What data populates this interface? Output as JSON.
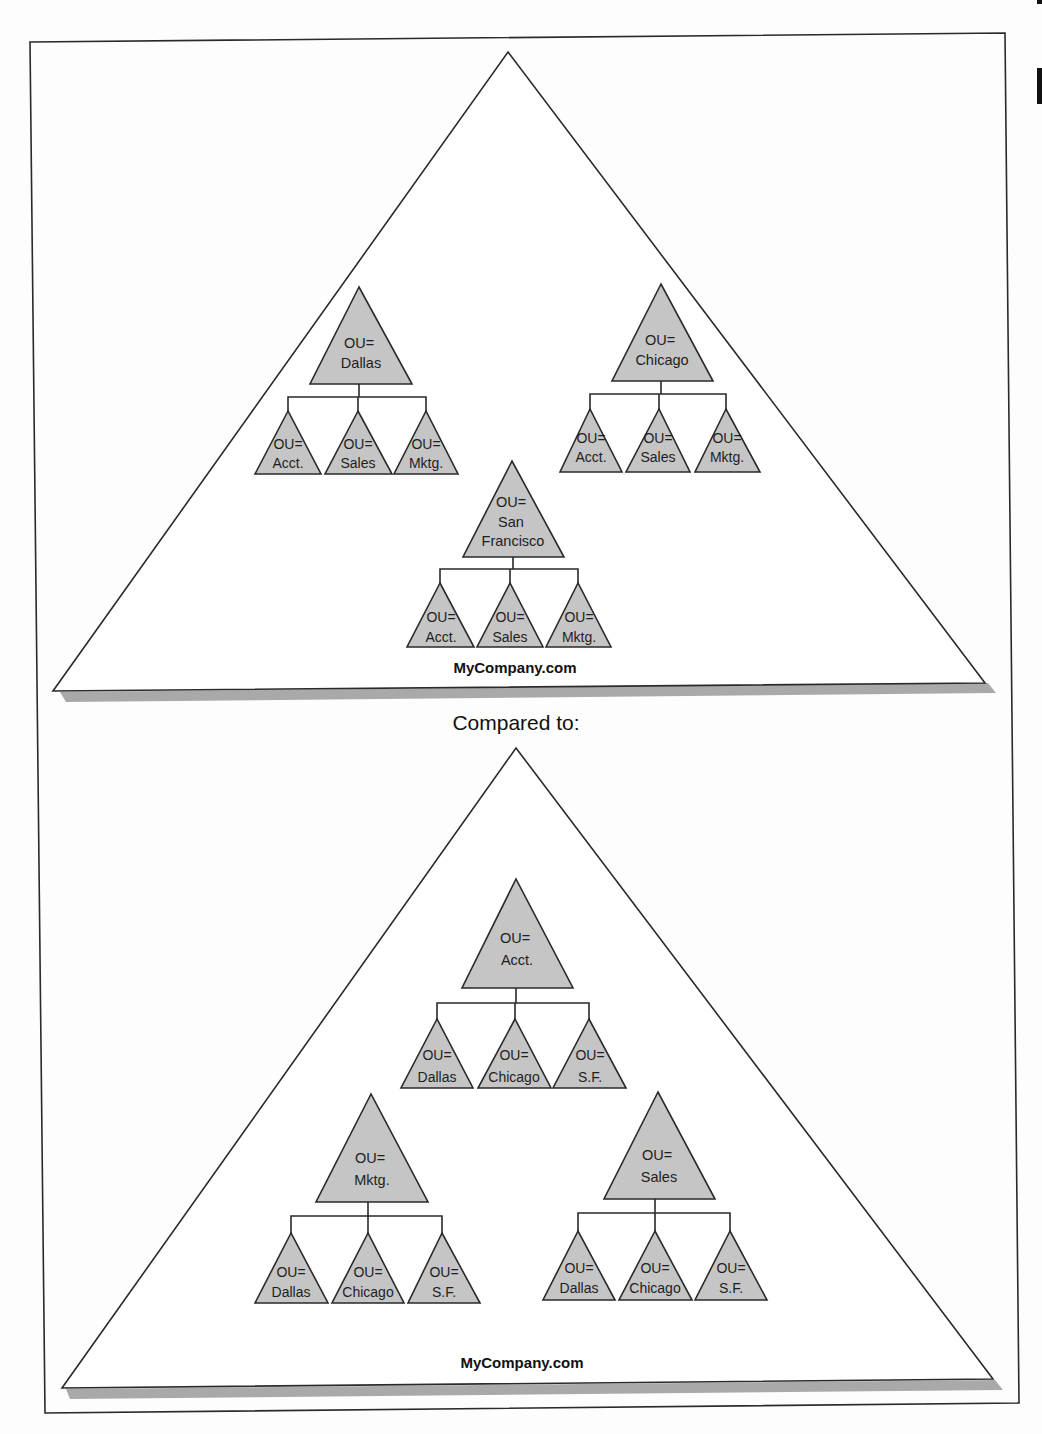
{
  "separator_text": "Compared to:",
  "diagrams": [
    {
      "root_label": "MyCompany.com",
      "ous": [
        {
          "label": [
            "OU=",
            "Dallas"
          ],
          "children": [
            [
              "OU=",
              "Acct."
            ],
            [
              "OU=",
              "Sales"
            ],
            [
              "OU=",
              "Mktg."
            ]
          ]
        },
        {
          "label": [
            "OU=",
            "Chicago"
          ],
          "children": [
            [
              "OU=",
              "Acct."
            ],
            [
              "OU=",
              "Sales"
            ],
            [
              "OU=",
              "Mktg."
            ]
          ]
        },
        {
          "label": [
            "OU=",
            "San",
            "Francisco"
          ],
          "children": [
            [
              "OU=",
              "Acct."
            ],
            [
              "OU=",
              "Sales"
            ],
            [
              "OU=",
              "Mktg."
            ]
          ]
        }
      ]
    },
    {
      "root_label": "MyCompany.com",
      "ous": [
        {
          "label": [
            "OU=",
            "Acct."
          ],
          "children": [
            [
              "OU=",
              "Dallas"
            ],
            [
              "OU=",
              "Chicago"
            ],
            [
              "OU=",
              "S.F."
            ]
          ]
        },
        {
          "label": [
            "OU=",
            "Mktg."
          ],
          "children": [
            [
              "OU=",
              "Dallas"
            ],
            [
              "OU=",
              "Chicago"
            ],
            [
              "OU=",
              "S.F."
            ]
          ]
        },
        {
          "label": [
            "OU=",
            "Sales"
          ],
          "children": [
            [
              "OU=",
              "Dallas"
            ],
            [
              "OU=",
              "Chicago"
            ],
            [
              "OU=",
              "S.F."
            ]
          ]
        }
      ]
    }
  ],
  "colors": {
    "ou_fill": "#c5c5c5",
    "shadow": "#a9a9a9",
    "stroke": "#2a2a2a"
  }
}
